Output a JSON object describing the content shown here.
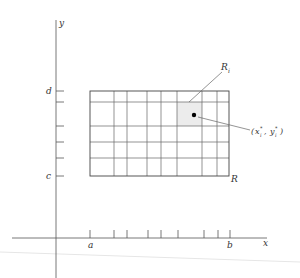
{
  "figure": {
    "colors": {
      "line": "#555555",
      "highlight": "#ececec",
      "point": "#000000",
      "text": "#333333"
    },
    "axes": {
      "x_label": "x",
      "y_label": "y",
      "x_start_label": "a",
      "x_end_label": "b",
      "y_start_label": "c",
      "y_end_label": "d"
    },
    "region_label": "R",
    "subrectangle_label": "R",
    "subrectangle_subscript": "i",
    "sample_point": {
      "open": "(",
      "x": "x",
      "x_sub": "i",
      "x_sup": "*",
      "sep": ", ",
      "y": "y",
      "y_sub": "i",
      "y_sup": "*",
      "close": ")"
    },
    "grid": {
      "x_lines_px": [
        90,
        114,
        127,
        147,
        161,
        177,
        202,
        217,
        229
      ],
      "y_lines_px": [
        91,
        102,
        126,
        142,
        158,
        176
      ],
      "highlight_cell": {
        "x0": 177,
        "x1": 202,
        "y0": 102,
        "y1": 126
      },
      "point_px": {
        "x": 194,
        "y": 115
      }
    }
  }
}
